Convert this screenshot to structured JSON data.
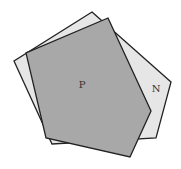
{
  "diagram": {
    "shapes": [
      {
        "id": "N",
        "label": "N",
        "fill": "#e6e6e6",
        "stroke": "#222222",
        "points": "92,12 171,82 156,138 52,144 14,61",
        "label_pos": [
          156,
          92
        ]
      },
      {
        "id": "P",
        "label": "P",
        "fill": "#a8a8a8",
        "stroke": "#222222",
        "points": "108,18 151,111 130,157 46,138 26,53",
        "label_pos": [
          82,
          88
        ]
      }
    ]
  }
}
